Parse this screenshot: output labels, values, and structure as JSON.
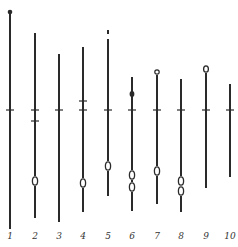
{
  "figure": {
    "tick_y": 110,
    "stroke_color": "#2a2a2a",
    "specimens": [
      {
        "label": "1",
        "x": 10,
        "top": 12,
        "bottom": 229,
        "ticks": [
          110
        ],
        "top_mark": "dot-small",
        "loops": [],
        "dots": []
      },
      {
        "label": "2",
        "x": 35,
        "top": 33,
        "bottom": 218,
        "ticks": [
          110,
          121
        ],
        "top_mark": "none",
        "loops": [
          181
        ],
        "dots": []
      },
      {
        "label": "3",
        "x": 59,
        "top": 54,
        "bottom": 222,
        "ticks": [
          110
        ],
        "top_mark": "none",
        "loops": [],
        "dots": []
      },
      {
        "label": "4",
        "x": 83,
        "top": 47,
        "bottom": 212,
        "ticks": [
          101,
          110
        ],
        "top_mark": "none",
        "loops": [
          183
        ],
        "dots": []
      },
      {
        "label": "5",
        "x": 108,
        "top": 30,
        "bottom": 196,
        "ticks": [
          110
        ],
        "top_mark": "gap",
        "loops": [
          166
        ],
        "dots": []
      },
      {
        "label": "6",
        "x": 132,
        "top": 77,
        "bottom": 211,
        "ticks": [
          110
        ],
        "top_mark": "none",
        "loops": [
          175,
          187
        ],
        "dots": [
          94
        ]
      },
      {
        "label": "7",
        "x": 157,
        "top": 72,
        "bottom": 204,
        "ticks": [
          110
        ],
        "top_mark": "circle-small",
        "loops": [
          171
        ],
        "dots": []
      },
      {
        "label": "8",
        "x": 181,
        "top": 79,
        "bottom": 212,
        "ticks": [
          110
        ],
        "top_mark": "none",
        "loops": [
          181,
          191
        ],
        "dots": []
      },
      {
        "label": "9",
        "x": 206,
        "top": 69,
        "bottom": 188,
        "ticks": [
          110
        ],
        "top_mark": "circle",
        "loops": [],
        "dots": []
      },
      {
        "label": "10",
        "x": 230,
        "top": 84,
        "bottom": 177,
        "ticks": [
          110
        ],
        "top_mark": "none",
        "loops": [],
        "dots": []
      }
    ],
    "label_y": 239
  }
}
